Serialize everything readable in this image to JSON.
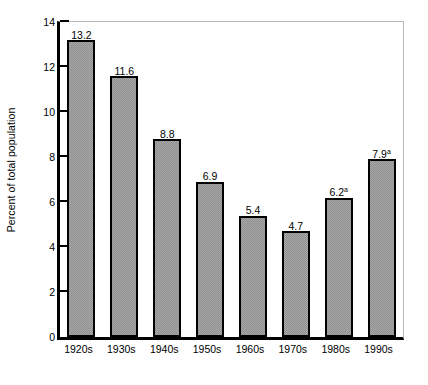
{
  "chart_data": {
    "type": "bar",
    "title": "",
    "subtitle": "",
    "xlabel": "",
    "ylabel": "Percent of total population",
    "ylim": [
      0,
      14
    ],
    "grid": false,
    "legend": "none",
    "categories": [
      "1920s",
      "1930s",
      "1940s",
      "1950s",
      "1960s",
      "1970s",
      "1980s",
      "1990s"
    ],
    "values": [
      13.2,
      11.6,
      8.8,
      6.9,
      5.4,
      4.7,
      6.2,
      7.9
    ],
    "value_labels": [
      "13.2",
      "11.6",
      "8.8",
      "6.9",
      "5.4",
      "4.7",
      "6.2",
      "7.9"
    ],
    "footnote_markers": [
      "",
      "",
      "",
      "",
      "",
      "",
      "a",
      "a"
    ],
    "y_ticks": [
      0,
      2,
      4,
      6,
      8,
      10,
      12,
      14
    ],
    "y_tick_labels": [
      "0",
      "2",
      "4",
      "6",
      "8",
      "10",
      "12",
      "14"
    ],
    "colors": {
      "bar_fill": "#a8a8a8",
      "bar_pattern": "#8f8f8f",
      "bar_border": "#000000",
      "axis": "#000000",
      "frame": "#b9b9b9",
      "background": "#ffffff",
      "text": "#000000"
    }
  }
}
